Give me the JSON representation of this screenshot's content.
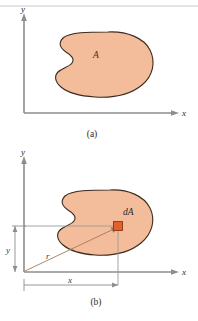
{
  "figure": {
    "background_color": "#ffffff",
    "panels": [
      {
        "id": "a",
        "caption": "(a)",
        "y_axis_label": "y",
        "x_axis_label": "x",
        "area_label": "A",
        "shape": "kidney-blob",
        "fill_color": "#F3BC9A",
        "outline_color": "#3d2a1e",
        "axis_color": "#8d8d8d"
      },
      {
        "id": "b",
        "caption": "(b)",
        "y_axis_label": "y",
        "x_axis_label": "x",
        "element_label": "dA",
        "horizontal_dimension_label": "x",
        "vertical_dimension_label": "y",
        "radial_dimension_label": "r",
        "shape": "kidney-blob",
        "fill_color": "#F3BC9A",
        "outline_color": "#3d2a1e",
        "element_fill_color": "#E2612A",
        "element_outline_color": "#8a3b10",
        "radial_line_color": "#a57a5a",
        "dimension_line_color": "#8d8d8d"
      }
    ]
  }
}
